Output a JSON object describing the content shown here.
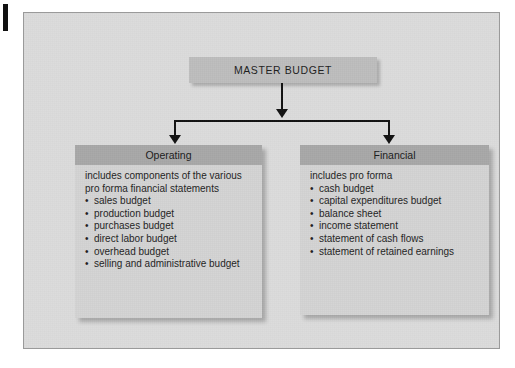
{
  "figure": {
    "root": {
      "label": "MASTER BUDGET"
    },
    "branches": [
      {
        "id": "operating",
        "header": "Operating",
        "intro": "includes components of the various pro forma financial statements",
        "items": [
          "sales budget",
          "production budget",
          "purchases budget",
          "direct labor budget",
          "overhead budget",
          "selling and administrative budget"
        ]
      },
      {
        "id": "financial",
        "header": "Financial",
        "intro": "includes pro forma",
        "items": [
          "cash budget",
          "capital expenditures budget",
          "balance sheet",
          "income statement",
          "statement of cash flows",
          "statement of retained earnings"
        ]
      }
    ],
    "colors": {
      "frame_background": "#dcdcdc",
      "frame_border": "#9a9a9a",
      "root_fill": "#bdbdbd",
      "panel_fill": "#d3d3d3",
      "panel_header_fill": "#a8a8a8",
      "connector": "#111111",
      "text": "#1f1f1f"
    }
  }
}
